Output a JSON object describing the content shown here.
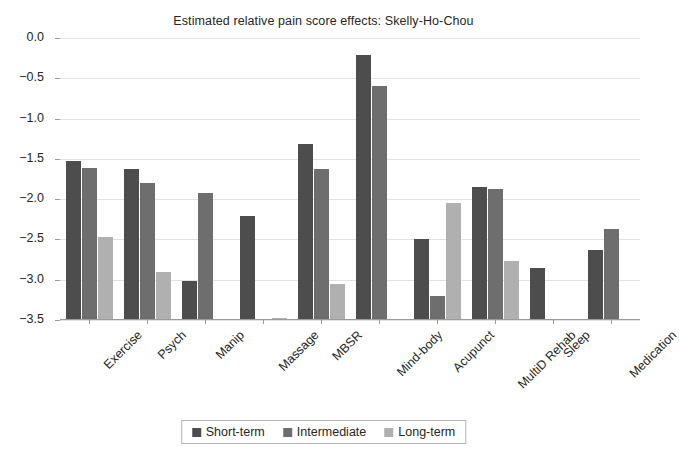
{
  "chart_data": {
    "type": "bar",
    "title": "Estimated relative pain score effects: Skelly-Ho-Chou",
    "xlabel": "",
    "ylabel": "",
    "ylim": [
      -3.5,
      0.0
    ],
    "yticks": [
      "-3.5",
      "-3.0",
      "-2.5",
      "-2.0",
      "-1.5",
      "-1.0",
      "-0.5",
      "0.0"
    ],
    "ytick_values": [
      -3.5,
      -3.0,
      -2.5,
      -2.0,
      -1.5,
      -1.0,
      -0.5,
      0.0
    ],
    "grid": true,
    "legend_position": "bottom",
    "categories": [
      "Exercise",
      "Psych",
      "Manip",
      "Massage",
      "MBSR",
      "Mind-body",
      "Acupunct",
      "MultiD Rehab",
      "Sleep",
      "Medication"
    ],
    "series": [
      {
        "name": "Short-term",
        "color": "#4d4d4d",
        "values": [
          -1.97,
          -1.87,
          -0.49,
          -1.29,
          -2.18,
          -3.29,
          -1.0,
          -1.65,
          -0.65,
          -0.87
        ]
      },
      {
        "name": "Intermediate",
        "color": "#6e6e6e",
        "values": [
          -1.89,
          -1.7,
          -1.58,
          0.0,
          -1.88,
          -2.9,
          -0.3,
          -1.62,
          0.0,
          -1.13
        ]
      },
      {
        "name": "Long-term",
        "color": "#b0b0b0",
        "values": [
          -1.03,
          -0.6,
          0.0,
          -0.02,
          -0.45,
          0.0,
          -1.45,
          -0.73,
          0.0,
          0.0
        ]
      }
    ]
  },
  "legend": {
    "entries": [
      {
        "label": "Short-term",
        "color": "#4d4d4d"
      },
      {
        "label": "Intermediate",
        "color": "#6e6e6e"
      },
      {
        "label": "Long-term",
        "color": "#b0b0b0"
      }
    ]
  }
}
